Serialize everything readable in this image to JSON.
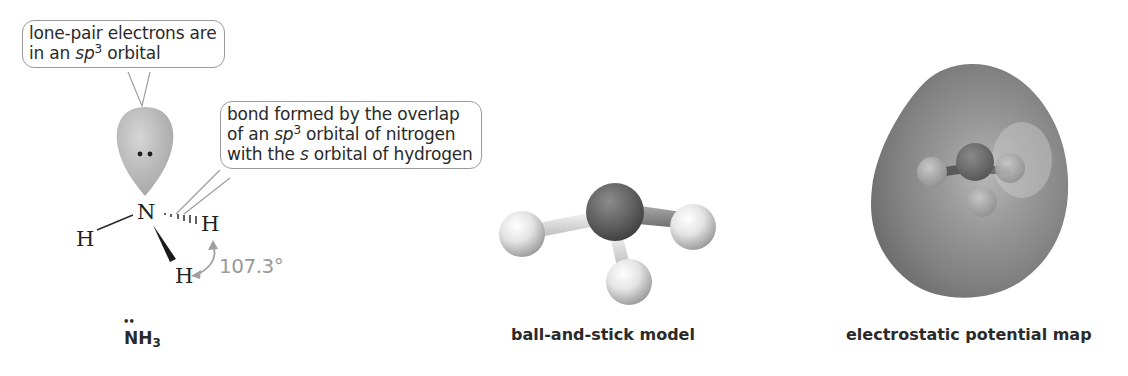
{
  "diagram": {
    "callouts": {
      "lone_pair": {
        "line1": "lone-pair electrons are",
        "line2_pre": "in an ",
        "line2_italic": "sp",
        "line2_sup": "3",
        "line2_post": " orbital"
      },
      "bond": {
        "line1": "bond formed by the overlap",
        "line2_pre": "of an ",
        "line2_italic": "sp",
        "line2_sup": "3",
        "line2_post": " orbital of nitrogen",
        "line3_pre": "with the ",
        "line3_italic": "s",
        "line3_post": " orbital of hydrogen"
      }
    },
    "atoms": {
      "central": "N",
      "h_left": "H",
      "h_right": "H",
      "h_bottom": "H"
    },
    "bond_angle": "107.3°",
    "formula": {
      "main": "NH",
      "sub": "3",
      "lone_pair_dots": "••"
    },
    "captions": {
      "ball_and_stick": "ball-and-stick model",
      "esp_map": "electrostatic potential map"
    },
    "colors": {
      "orbital": "#b5b5b5",
      "nitrogen_ball": "#5e5e5e",
      "hydrogen_ball": "#e2e2e2",
      "esp_surface": "#8a8a8a",
      "angle_text": "#9a9a9a",
      "callout_border": "#9a9a9a"
    }
  }
}
